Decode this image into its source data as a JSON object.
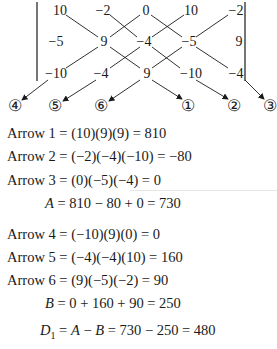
{
  "matrix": {
    "rows": [
      [
        "10",
        "−2",
        "0",
        "10",
        "−2"
      ],
      [
        "−5",
        "9",
        "−4",
        "−5",
        "9"
      ],
      [
        "−10",
        "−4",
        "9",
        "−10",
        "−4"
      ]
    ],
    "arrow_labels": [
      "④",
      "⑤",
      "⑥",
      "①",
      "②",
      "③"
    ]
  },
  "equations": {
    "arrow1": "Arrow 1 = (10)(9)(9) = 810",
    "arrow2": "Arrow 2 = (−2)(−4)(−10) = −80",
    "arrow3": "Arrow 3 = (0)(−5)(−4) = 0",
    "a_var": "A",
    "a_rest": " = 810 − 80 + 0 = 730",
    "arrow4": "Arrow 4 = (−10)(9)(0) = 0",
    "arrow5": "Arrow 5 = (−4)(−4)(10) = 160",
    "arrow6": "Arrow 6 = (9)(−5)(−2) = 90",
    "b_var": "B",
    "b_rest": " = 0 + 160 + 90 = 250",
    "d_var": "D",
    "d_sub": "1",
    "d_eq1": " = ",
    "d_a": "A",
    "d_minus": " − ",
    "d_b": "B",
    "d_rest": " = 730 − 250 = 480"
  }
}
